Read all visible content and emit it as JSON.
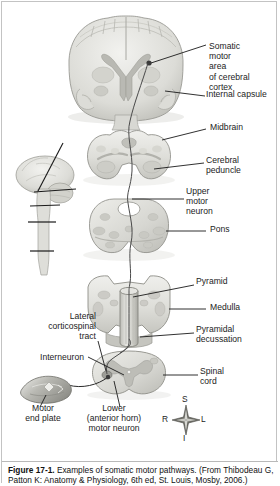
{
  "figure": {
    "title": "Examples of somatic motor pathways",
    "caption_number": "Figure 17-1.",
    "caption_line1": "Examples of somatic motor pathways.  (From Thibodeau G,",
    "caption_line2": "Patton K: Anatomy & Physiology, 6th ed, St. Louis, Mosby, 2006.)"
  },
  "labels": {
    "somatic_motor_area": "Somatic\nmotor\narea\nof cerebral\ncortex",
    "internal_capsule": "Internal capsule",
    "midbrain": "Midbrain",
    "cerebral_peduncle": "Cerebral\npeduncle",
    "upper_motor_neuron": "Upper\nmotor\nneuron",
    "pons": "Pons",
    "pyramid": "Pyramid",
    "medulla": "Medulla",
    "pyramidal_decussation": "Pyramidal\ndecussation",
    "spinal_cord": "Spinal\ncord",
    "lateral_corticospinal_tract": "Lateral\ncorticospinal\ntract",
    "interneuron": "Interneuron",
    "motor_end_plate": "Motor\nend plate",
    "lower_motor_neuron": "Lower\n(anterior horn)\nmotor neuron"
  },
  "compass": {
    "superior": "S",
    "inferior": "I",
    "right": "R",
    "left": "L"
  },
  "colors": {
    "tissue_light": "#e7e7e4",
    "tissue_mid": "#cfcfca",
    "tissue_dark": "#b4b4ae",
    "outline": "#8e8e88",
    "leader": "#1a1a1a",
    "border": "#c3c3c3",
    "text": "#1c1c1c"
  }
}
